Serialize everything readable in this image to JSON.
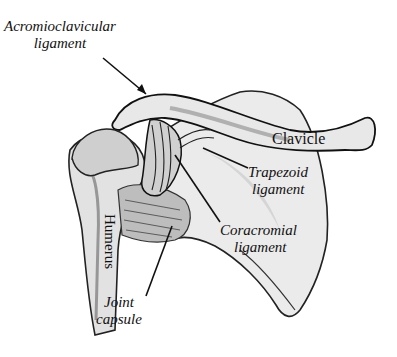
{
  "diagram": {
    "labels": {
      "acromioclavicular": {
        "line1": "Acromioclavicular",
        "line2": "ligament"
      },
      "clavicle": "Clavicle",
      "trapezoid": {
        "line1": "Trapezoid",
        "line2": "ligament"
      },
      "coracromial": {
        "line1": "Coracromial",
        "line2": "ligament"
      },
      "humerus": "Humerus",
      "joint_capsule": {
        "line1": "Joint",
        "line2": "capsule"
      }
    },
    "colors": {
      "background": "#ffffff",
      "ink": "#111111",
      "bone_shade": "#d9d9d9",
      "bone_light": "#efefef",
      "shadow": "#555555"
    }
  }
}
